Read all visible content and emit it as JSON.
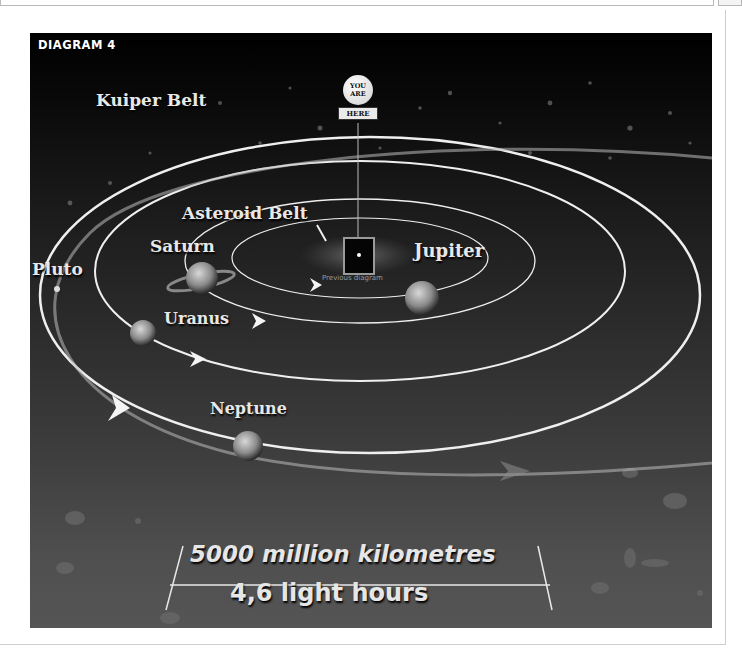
{
  "page": {
    "top_input": "",
    "top_button": ""
  },
  "diagram": {
    "title": "DIAGRAM 4",
    "you_are_here": {
      "line1": "YOU",
      "line2": "ARE",
      "plate": "HERE"
    },
    "previous_caption": "Previous diagram",
    "labels": {
      "kuiper_belt": "Kuiper Belt",
      "asteroid_belt": "Asteroid Belt",
      "saturn": "Saturn",
      "jupiter": "Jupiter",
      "pluto": "Pluto",
      "uranus": "Uranus",
      "neptune": "Neptune"
    },
    "scale": {
      "distance": "5000 million kilometres",
      "light_time": "4,6 light hours"
    },
    "colors": {
      "background_top": "#000000",
      "background_bottom": "#555555",
      "orbit": "#f0f0f0",
      "label": "#e8e8e8"
    }
  }
}
